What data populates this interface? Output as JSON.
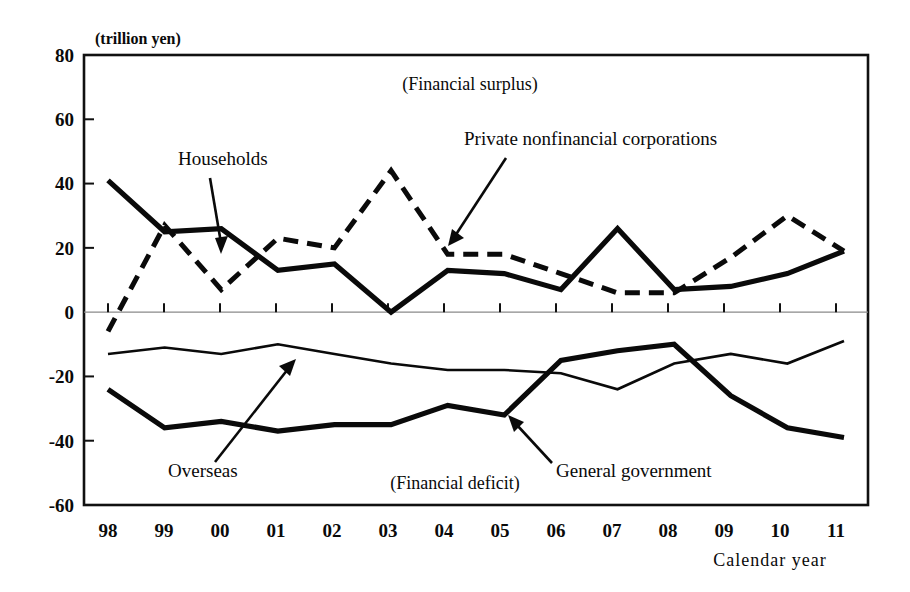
{
  "figure": {
    "unit_label": "(trillion yen)",
    "x_axis_caption": "Calendar year",
    "region_labels": {
      "upper": "(Financial surplus)",
      "lower": "(Financial deficit)"
    },
    "annotations": [
      {
        "name": "households",
        "label": "Households"
      },
      {
        "name": "private-nonfinancial-corporations",
        "label": "Private  nonfinancial  corporations"
      },
      {
        "name": "overseas",
        "label": "Overseas"
      },
      {
        "name": "general-government",
        "label": "General government"
      }
    ]
  },
  "chart_data": {
    "type": "line",
    "title": "",
    "subtitle": "",
    "xlabel": "Calendar year",
    "ylabel": "(trillion yen)",
    "grid": false,
    "legend": "annotations-with-arrows",
    "xlim": [
      1998,
      2011
    ],
    "ylim": [
      -60,
      80
    ],
    "yticks": [
      80,
      60,
      40,
      20,
      0,
      -20,
      -40,
      -60
    ],
    "ytick_labels": [
      "80",
      "60",
      "40",
      "20",
      "0",
      "-20",
      "-40",
      "-60"
    ],
    "x": [
      1998,
      1999,
      2000,
      2001,
      2002,
      2003,
      2004,
      2005,
      2006,
      2007,
      2008,
      2009,
      2010,
      2011
    ],
    "xtick_labels": [
      "98",
      "99",
      "00",
      "01",
      "02",
      "03",
      "04",
      "05",
      "06",
      "07",
      "08",
      "09",
      "10",
      "11"
    ],
    "series": [
      {
        "name": "Households",
        "style": "solid-thick",
        "values": [
          41,
          25,
          26,
          13,
          15,
          0,
          13,
          12,
          7,
          26,
          7,
          8,
          12,
          19
        ]
      },
      {
        "name": "Private nonfinancial corporations",
        "style": "dashed-thick",
        "values": [
          -6,
          27,
          7,
          23,
          20,
          44,
          18,
          18,
          12,
          6,
          6,
          17,
          30,
          19
        ]
      },
      {
        "name": "General government",
        "style": "solid-thick-lower",
        "values": [
          -24,
          -36,
          -34,
          -37,
          -35,
          -35,
          -29,
          -32,
          -15,
          -12,
          -10,
          -26,
          -36,
          -39
        ]
      },
      {
        "name": "Overseas",
        "style": "solid-thin",
        "values": [
          -13,
          -11,
          -13,
          -10,
          -13,
          -16,
          -18,
          -18,
          -19,
          -24,
          -16,
          -13,
          -16,
          -9
        ]
      }
    ]
  }
}
